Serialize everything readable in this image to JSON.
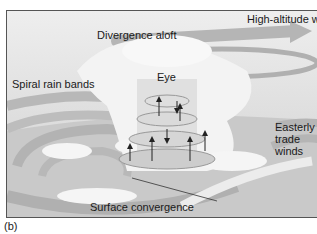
{
  "figure": {
    "panel_label": "(b)",
    "labels": {
      "high_altitude_winds": "High-altitude winds",
      "divergence_aloft": "Divergence aloft",
      "spiral_rain_bands": "Spiral rain bands",
      "eye": "Eye",
      "easterly_trade_winds_line1": "Easterly",
      "easterly_trade_winds_line2": "trade",
      "easterly_trade_winds_line3": "winds",
      "surface_convergence": "Surface convergence"
    },
    "colors": {
      "background": "#dcdcdc",
      "sky": "#e6e6e6",
      "clouds": "#f7f7f7",
      "arrows": "#a8a8a8",
      "surface": "#c8c8c8",
      "text": "#1a1a1a"
    }
  }
}
